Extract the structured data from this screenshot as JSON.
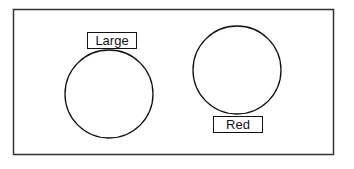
{
  "diagram": {
    "frame": {
      "x": 13,
      "y": 9,
      "width": 320,
      "height": 145,
      "stroke": "#333333"
    },
    "shapes": [
      {
        "kind": "circle",
        "cx": 109,
        "cy": 94,
        "r": 44,
        "label": {
          "text": "Large",
          "x": 87,
          "y": 32,
          "width": 49,
          "height": 16,
          "position": "above"
        }
      },
      {
        "kind": "circle",
        "cx": 237,
        "cy": 70,
        "r": 44,
        "label": {
          "text": "Red",
          "x": 213,
          "y": 116,
          "width": 49,
          "height": 16,
          "position": "below"
        }
      }
    ]
  }
}
